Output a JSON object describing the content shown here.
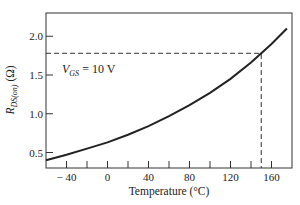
{
  "chart_data": {
    "type": "line",
    "title": "",
    "xlabel": "Temperature (°C)",
    "ylabel": "R_DS(on) (Ω)",
    "xlim": [
      -60,
      180
    ],
    "ylim": [
      0.3,
      2.3
    ],
    "x_ticks": [
      -40,
      0,
      40,
      80,
      120,
      160
    ],
    "x_tick_labels": [
      "− 40",
      "0",
      "40",
      "80",
      "120",
      "160"
    ],
    "x_minor_ticks": [
      -20,
      20,
      60,
      100,
      140
    ],
    "y_ticks": [
      0.5,
      1.0,
      1.5,
      2.0
    ],
    "y_tick_labels": [
      "0.5",
      "1.0",
      "1.5",
      "2.0"
    ],
    "grid": false,
    "series": [
      {
        "name": "VGS = 10 V",
        "x": [
          -60,
          -40,
          -20,
          0,
          20,
          40,
          60,
          80,
          100,
          120,
          140,
          150,
          160,
          175
        ],
        "y": [
          0.4,
          0.47,
          0.55,
          0.63,
          0.73,
          0.84,
          0.97,
          1.11,
          1.27,
          1.45,
          1.66,
          1.78,
          1.9,
          2.1
        ]
      }
    ],
    "annotations": [
      {
        "text": "V_GS = 10 V",
        "x": -40,
        "y": 1.62
      },
      {
        "type": "dashed-guide",
        "x": 150,
        "y": 1.78
      }
    ]
  },
  "labels": {
    "annotation_v": "V",
    "annotation_sub": "GS",
    "annotation_rest": " = 10 V",
    "ylabel_r": "R",
    "ylabel_sub": "DS(on)",
    "ylabel_rest": " (Ω)",
    "xlabel": "Temperature (°C)"
  }
}
